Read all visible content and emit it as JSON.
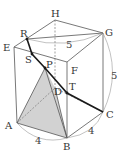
{
  "figure": {
    "colors": {
      "edge": "#555555",
      "hidden_edge": "#777777",
      "path": "#1a1a1a",
      "shade": "#cfcfcf",
      "arc": "#999999",
      "label": "#333333"
    },
    "vertices": {
      "A": {
        "label": "A",
        "x": 17,
        "y": 123,
        "lx": 5,
        "ly": 129
      },
      "B": {
        "label": "B",
        "x": 67,
        "y": 138,
        "lx": 63,
        "ly": 150
      },
      "C": {
        "label": "C",
        "x": 103,
        "y": 112,
        "lx": 106,
        "ly": 118
      },
      "D": {
        "label": "D",
        "x": 55,
        "y": 88,
        "lx": 54,
        "ly": 95
      },
      "E": {
        "label": "E",
        "x": 14,
        "y": 47,
        "lx": 3,
        "ly": 51
      },
      "F": {
        "label": "F",
        "x": 67,
        "y": 62,
        "lx": 71,
        "ly": 74
      },
      "G": {
        "label": "G",
        "x": 103,
        "y": 33,
        "lx": 105,
        "ly": 36
      },
      "H": {
        "label": "H",
        "x": 55,
        "y": 20,
        "lx": 51,
        "ly": 17
      },
      "R": {
        "label": "R",
        "x": 27,
        "y": 39,
        "lx": 20,
        "ly": 37
      },
      "S": {
        "label": "S",
        "x": 32,
        "y": 54,
        "lx": 25,
        "ly": 63
      },
      "P": {
        "label": "P",
        "x": 45,
        "y": 68,
        "lx": 46,
        "ly": 68
      },
      "T": {
        "label": "T",
        "x": 67,
        "y": 93,
        "lx": 69,
        "ly": 90
      }
    },
    "dimensions": [
      {
        "label": "5",
        "x": 66,
        "y": 48,
        "meaning": "RG"
      },
      {
        "label": "5",
        "x": 111,
        "y": 79,
        "meaning": "GC"
      },
      {
        "label": "4",
        "x": 35,
        "y": 144,
        "meaning": "AB"
      },
      {
        "label": "4",
        "x": 88,
        "y": 134,
        "meaning": "BC"
      }
    ]
  }
}
